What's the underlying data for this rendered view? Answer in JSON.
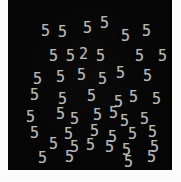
{
  "panel": {
    "name": "visual-search-display",
    "background_color": "#050505",
    "page_background_color": "#fdfdfd",
    "glyph_color": "#b9b9b9",
    "width": 164,
    "height": 170,
    "left": 8,
    "top": 0
  },
  "task": {
    "type": "visual-search",
    "target_character": "2",
    "distractor_character": "5",
    "target_count": 1,
    "distractor_count": 45,
    "total_items": 46
  },
  "items": [
    {
      "char": "5",
      "x": 33,
      "y": 24,
      "rot": 0,
      "role": "distractor"
    },
    {
      "char": "5",
      "x": 50,
      "y": 25,
      "rot": 0,
      "role": "distractor"
    },
    {
      "char": "5",
      "x": 75,
      "y": 21,
      "rot": 0,
      "role": "distractor"
    },
    {
      "char": "5",
      "x": 92,
      "y": 16,
      "rot": 0,
      "role": "distractor"
    },
    {
      "char": "5",
      "x": 113,
      "y": 29,
      "rot": 0,
      "role": "distractor"
    },
    {
      "char": "5",
      "x": 134,
      "y": 24,
      "rot": 0,
      "role": "distractor"
    },
    {
      "char": "5",
      "x": 41,
      "y": 49,
      "rot": 0,
      "role": "distractor"
    },
    {
      "char": "5",
      "x": 58,
      "y": 49,
      "rot": 0,
      "role": "distractor"
    },
    {
      "char": "2",
      "x": 71,
      "y": 47,
      "rot": 0,
      "role": "target"
    },
    {
      "char": "5",
      "x": 88,
      "y": 49,
      "rot": 0,
      "role": "distractor"
    },
    {
      "char": "5",
      "x": 127,
      "y": 49,
      "rot": 0,
      "role": "distractor"
    },
    {
      "char": "5",
      "x": 150,
      "y": 49,
      "rot": 0,
      "role": "distractor"
    },
    {
      "char": "5",
      "x": 25,
      "y": 72,
      "rot": 0,
      "role": "distractor"
    },
    {
      "char": "5",
      "x": 48,
      "y": 70,
      "rot": 0,
      "role": "distractor"
    },
    {
      "char": "5",
      "x": 69,
      "y": 68,
      "rot": 0,
      "role": "distractor"
    },
    {
      "char": "5",
      "x": 90,
      "y": 72,
      "rot": 0,
      "role": "distractor"
    },
    {
      "char": "5",
      "x": 108,
      "y": 66,
      "rot": 0,
      "role": "distractor"
    },
    {
      "char": "5",
      "x": 135,
      "y": 69,
      "rot": 0,
      "role": "distractor"
    },
    {
      "char": "5",
      "x": 22,
      "y": 88,
      "rot": 0,
      "role": "distractor"
    },
    {
      "char": "5",
      "x": 50,
      "y": 92,
      "rot": 0,
      "role": "distractor"
    },
    {
      "char": "5",
      "x": 79,
      "y": 89,
      "rot": 0,
      "role": "distractor"
    },
    {
      "char": "5",
      "x": 106,
      "y": 95,
      "rot": 0,
      "role": "distractor"
    },
    {
      "char": "5",
      "x": 121,
      "y": 90,
      "rot": 0,
      "role": "distractor"
    },
    {
      "char": "5",
      "x": 144,
      "y": 92,
      "rot": 0,
      "role": "distractor"
    },
    {
      "char": "5",
      "x": 18,
      "y": 110,
      "rot": 0,
      "role": "distractor"
    },
    {
      "char": "5",
      "x": 48,
      "y": 107,
      "rot": 0,
      "role": "distractor"
    },
    {
      "char": "5",
      "x": 62,
      "y": 112,
      "rot": 0,
      "role": "distractor"
    },
    {
      "char": "5",
      "x": 85,
      "y": 108,
      "rot": 0,
      "role": "distractor"
    },
    {
      "char": "5",
      "x": 101,
      "y": 106,
      "rot": 0,
      "role": "distractor"
    },
    {
      "char": "5",
      "x": 112,
      "y": 114,
      "rot": 0,
      "role": "distractor"
    },
    {
      "char": "5",
      "x": 132,
      "y": 112,
      "rot": 0,
      "role": "distractor"
    },
    {
      "char": "5",
      "x": 22,
      "y": 126,
      "rot": 0,
      "role": "distractor"
    },
    {
      "char": "5",
      "x": 56,
      "y": 127,
      "rot": 0,
      "role": "distractor"
    },
    {
      "char": "5",
      "x": 82,
      "y": 124,
      "rot": 0,
      "role": "distractor"
    },
    {
      "char": "5",
      "x": 100,
      "y": 130,
      "rot": 0,
      "role": "distractor"
    },
    {
      "char": "5",
      "x": 120,
      "y": 127,
      "rot": 0,
      "role": "distractor"
    },
    {
      "char": "5",
      "x": 140,
      "y": 125,
      "rot": 0,
      "role": "distractor"
    },
    {
      "char": "5",
      "x": 41,
      "y": 137,
      "rot": 0,
      "role": "distractor"
    },
    {
      "char": "5",
      "x": 62,
      "y": 140,
      "rot": 0,
      "role": "distractor"
    },
    {
      "char": "5",
      "x": 78,
      "y": 138,
      "rot": 0,
      "role": "distractor"
    },
    {
      "char": "5",
      "x": 97,
      "y": 140,
      "rot": 0,
      "role": "distractor"
    },
    {
      "char": "5",
      "x": 114,
      "y": 143,
      "rot": 0,
      "role": "distractor"
    },
    {
      "char": "5",
      "x": 142,
      "y": 140,
      "rot": 0,
      "role": "distractor"
    },
    {
      "char": "5",
      "x": 30,
      "y": 151,
      "rot": 0,
      "role": "distractor"
    },
    {
      "char": "5",
      "x": 57,
      "y": 150,
      "rot": 0,
      "role": "distractor"
    },
    {
      "char": "5",
      "x": 116,
      "y": 155,
      "rot": 0,
      "role": "distractor"
    },
    {
      "char": "5",
      "x": 139,
      "y": 150,
      "rot": 0,
      "role": "distractor"
    }
  ]
}
